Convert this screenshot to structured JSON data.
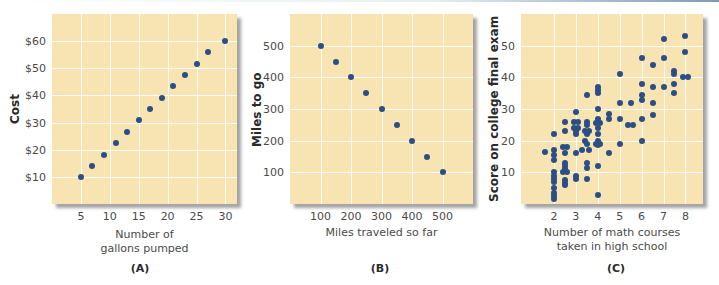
{
  "chart_data": [
    {
      "type": "scatter",
      "caption": "(A)",
      "title": "",
      "xlabel": "Number of gallons pumped",
      "xlabel_lines": [
        "Number of",
        "gallons pumped"
      ],
      "ylabel": "Cost",
      "x_ticks": [
        5,
        10,
        15,
        20,
        25,
        30
      ],
      "x_tick_labels": [
        "5",
        "10",
        "15",
        "20",
        "25",
        "30"
      ],
      "y_ticks": [
        10,
        20,
        30,
        40,
        50,
        60
      ],
      "y_tick_labels": [
        "$10",
        "$20",
        "$30",
        "$40",
        "$50",
        "$60"
      ],
      "xlim": [
        0,
        32
      ],
      "ylim": [
        0,
        70
      ],
      "grid": true,
      "points": [
        [
          5,
          10
        ],
        [
          7,
          14
        ],
        [
          9,
          18
        ],
        [
          11,
          22.5
        ],
        [
          13,
          26.5
        ],
        [
          15,
          31
        ],
        [
          17,
          35
        ],
        [
          19,
          39
        ],
        [
          21,
          43.5
        ],
        [
          23,
          47.5
        ],
        [
          25,
          51.5
        ],
        [
          27,
          56
        ],
        [
          30,
          60
        ]
      ]
    },
    {
      "type": "scatter",
      "caption": "(B)",
      "title": "",
      "xlabel": "Miles traveled so far",
      "xlabel_lines": [
        "Miles traveled so far"
      ],
      "ylabel": "Miles to go",
      "x_ticks": [
        100,
        200,
        300,
        400,
        500
      ],
      "x_tick_labels": [
        "100",
        "200",
        "300",
        "400",
        "500"
      ],
      "y_ticks": [
        100,
        200,
        300,
        400,
        500
      ],
      "y_tick_labels": [
        "100",
        "200",
        "300",
        "400",
        "500"
      ],
      "xlim": [
        0,
        600
      ],
      "ylim": [
        0,
        600
      ],
      "grid": true,
      "points": [
        [
          100,
          500
        ],
        [
          150,
          450
        ],
        [
          200,
          400
        ],
        [
          250,
          350
        ],
        [
          300,
          300
        ],
        [
          350,
          250
        ],
        [
          400,
          200
        ],
        [
          450,
          150
        ],
        [
          500,
          100
        ]
      ]
    },
    {
      "type": "scatter",
      "caption": "(C)",
      "title": "",
      "xlabel": "Number of math courses taken in high school",
      "xlabel_lines": [
        "Number of math courses",
        "taken in high school"
      ],
      "ylabel": "Score on college final exam",
      "x_ticks": [
        2,
        3,
        4,
        5,
        6,
        7,
        8
      ],
      "x_tick_labels": [
        "2",
        "3",
        "4",
        "5",
        "6",
        "7",
        "8"
      ],
      "y_ticks": [
        10,
        20,
        30,
        40,
        50
      ],
      "y_tick_labels": [
        "10",
        "20",
        "30",
        "40",
        "50"
      ],
      "xlim": [
        0.5,
        8.8
      ],
      "ylim": [
        0,
        60
      ],
      "grid": true,
      "points": [
        [
          1.6,
          16.5
        ],
        [
          2,
          22
        ],
        [
          2,
          17
        ],
        [
          2,
          15.5
        ],
        [
          2,
          14
        ],
        [
          2,
          10
        ],
        [
          2,
          9
        ],
        [
          2,
          8
        ],
        [
          2,
          7
        ],
        [
          2,
          5
        ],
        [
          2,
          3.5
        ],
        [
          2,
          2.5
        ],
        [
          2,
          1.5
        ],
        [
          2.5,
          26
        ],
        [
          2.5,
          23
        ],
        [
          2.4,
          18
        ],
        [
          2.6,
          18
        ],
        [
          2.5,
          16
        ],
        [
          2.5,
          13
        ],
        [
          2.5,
          12
        ],
        [
          2.5,
          11
        ],
        [
          2.4,
          10
        ],
        [
          2.6,
          10
        ],
        [
          2.5,
          7.5
        ],
        [
          2.5,
          6.5
        ],
        [
          2.5,
          6
        ],
        [
          2.9,
          26
        ],
        [
          3.1,
          26
        ],
        [
          3,
          29
        ],
        [
          2.9,
          24
        ],
        [
          3.1,
          24
        ],
        [
          3,
          23
        ],
        [
          3,
          22
        ],
        [
          3,
          16
        ],
        [
          3,
          9
        ],
        [
          3,
          8
        ],
        [
          3.5,
          34.5
        ],
        [
          3.5,
          26
        ],
        [
          3.5,
          25
        ],
        [
          3.4,
          23
        ],
        [
          3.6,
          23
        ],
        [
          3.5,
          22
        ],
        [
          3.4,
          20
        ],
        [
          3.5,
          19
        ],
        [
          3.6,
          17
        ],
        [
          3.3,
          17
        ],
        [
          3.5,
          13
        ],
        [
          3.5,
          11.5
        ],
        [
          3.5,
          8
        ],
        [
          4,
          37
        ],
        [
          4,
          36
        ],
        [
          4,
          35
        ],
        [
          4,
          30
        ],
        [
          4,
          27
        ],
        [
          3.9,
          25.5
        ],
        [
          4.1,
          25.5
        ],
        [
          4,
          24
        ],
        [
          4,
          22
        ],
        [
          4,
          20
        ],
        [
          3.9,
          19
        ],
        [
          4.1,
          19
        ],
        [
          4,
          18.5
        ],
        [
          4,
          12
        ],
        [
          4,
          3
        ],
        [
          4.5,
          28.5
        ],
        [
          4.5,
          27
        ],
        [
          4.5,
          16
        ],
        [
          5,
          41
        ],
        [
          5,
          32
        ],
        [
          5,
          27
        ],
        [
          5,
          19
        ],
        [
          5.5,
          32
        ],
        [
          5.4,
          25
        ],
        [
          5.6,
          25
        ],
        [
          6,
          46
        ],
        [
          6,
          38
        ],
        [
          6,
          34.5
        ],
        [
          6,
          33
        ],
        [
          6,
          27
        ],
        [
          6,
          20
        ],
        [
          6.5,
          44
        ],
        [
          6.5,
          37
        ],
        [
          6.5,
          32
        ],
        [
          6.5,
          28
        ],
        [
          7,
          52
        ],
        [
          7,
          46
        ],
        [
          7,
          37
        ],
        [
          7.5,
          42
        ],
        [
          7.5,
          41
        ],
        [
          7.5,
          38
        ],
        [
          7.5,
          35
        ],
        [
          8,
          53
        ],
        [
          8,
          48
        ],
        [
          7.9,
          40
        ],
        [
          8.1,
          40
        ]
      ]
    }
  ]
}
